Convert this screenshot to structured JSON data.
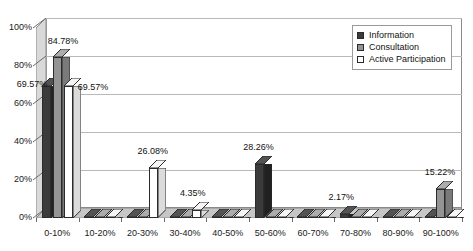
{
  "chart_data": {
    "type": "bar",
    "title": "",
    "subtitle": "",
    "xlabel": "",
    "ylabel": "",
    "ylim": [
      0,
      100
    ],
    "y_ticks": [
      "0%",
      "20%",
      "40%",
      "60%",
      "80%",
      "100%"
    ],
    "y_tick_values": [
      0,
      20,
      40,
      60,
      80,
      100
    ],
    "grid": true,
    "legend_position": "top-right",
    "three_d": true,
    "categories": [
      "0-10%",
      "10-20%",
      "20-30%",
      "30-40%",
      "40-50%",
      "50-60%",
      "60-70%",
      "70-80%",
      "80-90%",
      "90-100%"
    ],
    "series": [
      {
        "name": "Information",
        "color": "#3b3b3b",
        "values": [
          69.57,
          0,
          0,
          0,
          0,
          28.26,
          0,
          2.17,
          0,
          0
        ],
        "labels": [
          "69.57%",
          "",
          "",
          "",
          "",
          "28.26%",
          "",
          "2.17%",
          "",
          ""
        ]
      },
      {
        "name": "Consultation",
        "color": "#949494",
        "values": [
          84.78,
          0,
          0,
          0,
          0,
          0,
          0,
          0,
          0,
          15.22
        ],
        "labels": [
          "84.78%",
          "",
          "",
          "",
          "",
          "",
          "",
          "",
          "",
          "15.22%"
        ]
      },
      {
        "name": "Active Participation",
        "color": "#ffffff",
        "values": [
          69.57,
          0,
          26.08,
          4.35,
          0,
          0,
          0,
          0,
          0,
          0
        ],
        "labels": [
          "69.57%",
          "",
          "26.08%",
          "4.35%",
          "",
          "",
          "",
          "",
          "",
          ""
        ]
      }
    ]
  },
  "legend": {
    "items": [
      {
        "label": "Information",
        "color": "#3b3b3b"
      },
      {
        "label": "Consultation",
        "color": "#949494"
      },
      {
        "label": "Active Participation",
        "color": "#ffffff"
      }
    ]
  }
}
